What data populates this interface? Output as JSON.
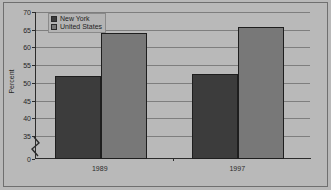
{
  "chart_data": {
    "type": "bar",
    "title": "",
    "xlabel": "",
    "ylabel": "Percent",
    "categories": [
      "1989",
      "1997"
    ],
    "series": [
      {
        "name": "New York",
        "values": [
          52,
          52.5
        ],
        "color": "#3c3c3c"
      },
      {
        "name": "United States",
        "values": [
          64,
          65.7
        ],
        "color": "#787878"
      }
    ],
    "ylim": [
      35,
      70
    ],
    "yticks": [
      70,
      65,
      60,
      55,
      50,
      45,
      40,
      35,
      0
    ],
    "axis_break": true,
    "axis_break_between": [
      35,
      0
    ],
    "grid": true,
    "grid_axis": "y",
    "legend_position": "upper-left"
  },
  "legend": {
    "items": [
      {
        "label": "New York"
      },
      {
        "label": "United States"
      }
    ]
  },
  "axes": {
    "y_title": "Percent",
    "y_tick_labels": [
      "70",
      "65",
      "60",
      "55",
      "50",
      "45",
      "40",
      "35",
      "0"
    ],
    "x_tick_labels": [
      "1989",
      "1997"
    ]
  }
}
